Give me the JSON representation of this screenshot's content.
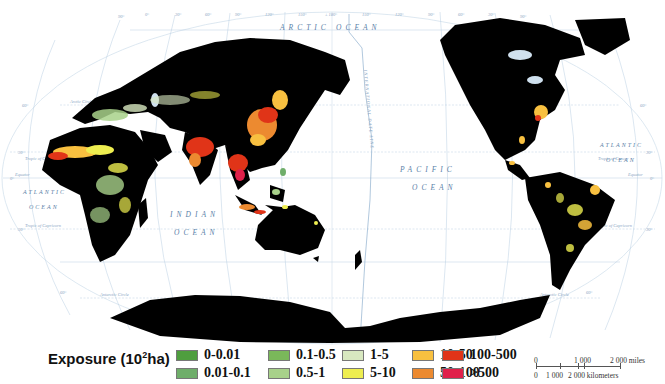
{
  "map": {
    "projection": "Robinson (Pacific-centered)",
    "ocean_labels": [
      {
        "text": "ARCTIC",
        "x": 280,
        "y": 30
      },
      {
        "text": "OCEAN",
        "x": 336,
        "y": 30
      },
      {
        "text": "PACIFIC",
        "x": 400,
        "y": 172
      },
      {
        "text": "OCEAN",
        "x": 412,
        "y": 190
      },
      {
        "text": "INDIAN",
        "x": 170,
        "y": 217
      },
      {
        "text": "OCEAN",
        "x": 174,
        "y": 235
      },
      {
        "text": "ATLANTIC",
        "x": 23,
        "y": 194
      },
      {
        "text": "OCEAN",
        "x": 29,
        "y": 209
      },
      {
        "text": "ATLANTIC",
        "x": 600,
        "y": 147
      },
      {
        "text": "OCEAN",
        "x": 606,
        "y": 162
      }
    ],
    "graticule_labels": {
      "top_longitudes": [
        "90°",
        "0°",
        "30°",
        "60°",
        "90°",
        "120°",
        "150°",
        "± 180°",
        "150°",
        "120°",
        "90°",
        "60°",
        "30°",
        "90°"
      ],
      "latitudes": [
        "60°",
        "30°",
        "0°",
        "30°",
        "60°"
      ],
      "lines": [
        "Arctic Circle",
        "Tropic of Cancer",
        "Equator",
        "Tropic of Capricorn",
        "Antarctic Circle"
      ],
      "dateline": "INTERNATIONAL DATE LINE"
    },
    "colors": {
      "land_no_data": "#000000",
      "ocean": "#ffffff",
      "graticule": "#a8c4dc",
      "ice_highlight": "#cfe0ee"
    }
  },
  "legend": {
    "title": "Exposure (10",
    "title_sup": "2",
    "title_suffix": "ha)",
    "items": [
      {
        "label": "0-0.01",
        "color": "#4f9e3f"
      },
      {
        "label": "0.01-0.1",
        "color": "#6fae6a"
      },
      {
        "label": "0.1-0.5",
        "color": "#7ab85a"
      },
      {
        "label": "0.5-1",
        "color": "#a8d18a"
      },
      {
        "label": "1-5",
        "color": "#d8e8c0"
      },
      {
        "label": "5-10",
        "color": "#eeee50"
      },
      {
        "label": "10-50",
        "color": "#f8c040"
      },
      {
        "label": "50-100",
        "color": "#ec8a30"
      },
      {
        "label": "100-500",
        "color": "#e03418"
      },
      {
        "label": ">500",
        "color": "#e0204a"
      }
    ]
  },
  "scale_bar": {
    "miles_labels": [
      "0",
      "1 000",
      "2 000 miles"
    ],
    "km_labels": [
      "0",
      "1 000",
      "2 000 kilometers"
    ]
  }
}
